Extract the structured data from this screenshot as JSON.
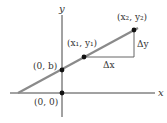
{
  "diagram": {
    "axes": {
      "x_label": "x",
      "y_label": "y"
    },
    "points": [
      {
        "id": "origin",
        "label": "(0, 0)"
      },
      {
        "id": "intercept",
        "label": "(0, b)"
      },
      {
        "id": "p1",
        "label": "(x₁, y₁)"
      },
      {
        "id": "p2",
        "label": "(x₂, y₂)"
      }
    ],
    "annotations": {
      "run": "Δx",
      "rise": "Δy"
    },
    "colors": {
      "line": "#8a8a8a",
      "axes": "#333333",
      "points": "#111111",
      "triangle": "#555555"
    }
  }
}
